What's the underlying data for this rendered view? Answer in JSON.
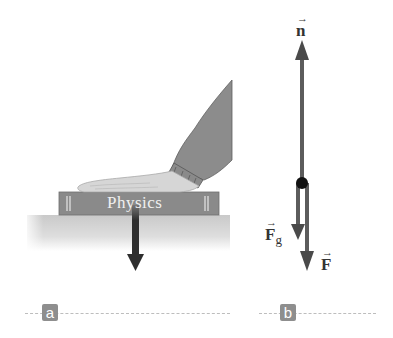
{
  "figure": {
    "panel_a": {
      "tag": "a",
      "book_title": "Physics",
      "objects": [
        "hand",
        "sleeve",
        "book",
        "table",
        "downward-force-arrow"
      ]
    },
    "panel_b": {
      "tag": "b",
      "vectors": [
        {
          "name": "normal-force",
          "symbol": "n",
          "subscript": "",
          "direction": "up"
        },
        {
          "name": "gravity-force",
          "symbol": "F",
          "subscript": "g",
          "direction": "down"
        },
        {
          "name": "applied-force",
          "symbol": "F",
          "subscript": "",
          "direction": "down"
        }
      ]
    },
    "colors": {
      "arrow": "#555555",
      "arrow_dark": "#333333",
      "book": "#8a8a8a",
      "sleeve": "#8c8c8c",
      "hand": "#d4d4d4",
      "table": "#cfcfcf",
      "tag_bg": "#8e8e8e"
    }
  }
}
